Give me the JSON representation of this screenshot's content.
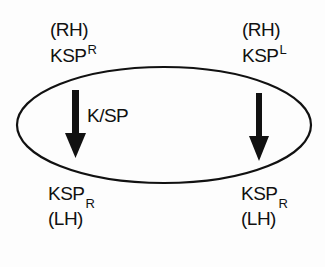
{
  "diagram": {
    "top_left": {
      "line1": "(RH)",
      "base": "KSP",
      "sup": "R"
    },
    "top_right": {
      "line1": "(RH)",
      "base": "KSP",
      "sup": "L"
    },
    "arrow_label": "K/SP",
    "bottom_left": {
      "base": "KSP",
      "sub": "R",
      "line2": "(LH)"
    },
    "bottom_right": {
      "base": "KSP",
      "sub": "R",
      "line2": "(LH)"
    },
    "colors": {
      "ink": "#111111",
      "background": "#fdfdfd"
    }
  }
}
